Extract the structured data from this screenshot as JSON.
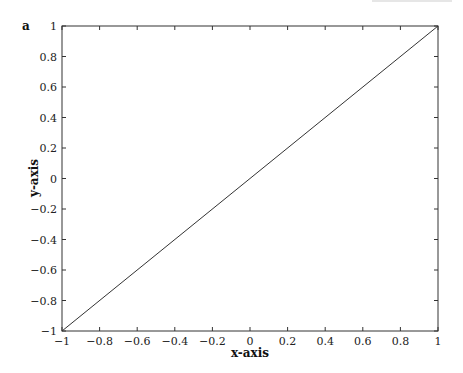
{
  "panel_label": "a",
  "chart_data": {
    "type": "line",
    "title": "",
    "xlabel": "x-axis",
    "ylabel": "y-axis",
    "xlim": [
      -1,
      1
    ],
    "ylim": [
      -1,
      1
    ],
    "xticks": [
      -1,
      -0.8,
      -0.6,
      -0.4,
      -0.2,
      0,
      0.2,
      0.4,
      0.6,
      0.8,
      1
    ],
    "yticks": [
      -1,
      -0.8,
      -0.6,
      -0.4,
      -0.2,
      0,
      0.2,
      0.4,
      0.6,
      0.8,
      1
    ],
    "xtick_labels": [
      "−1",
      "−0.8",
      "−0.6",
      "−0.4",
      "−0.2",
      "0",
      "0.2",
      "0.4",
      "0.6",
      "0.8",
      "1"
    ],
    "ytick_labels": [
      "−1",
      "−0.8",
      "−0.6",
      "−0.4",
      "−0.2",
      "0",
      "0.2",
      "0.4",
      "0.6",
      "0.8",
      "1"
    ],
    "grid": false,
    "legend": null,
    "series": [
      {
        "name": "y = x",
        "x": [
          -1,
          1
        ],
        "y": [
          -1,
          1
        ],
        "color": "#333333"
      }
    ]
  },
  "colors": {
    "axis": "#333333",
    "line": "#333333",
    "background": "#ffffff"
  }
}
